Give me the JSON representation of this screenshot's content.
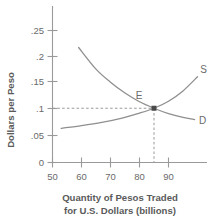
{
  "chart_data": {
    "type": "line",
    "title": "",
    "xlabel": "Quantity of Pesos Traded for U.S. Dollars (billions)",
    "xlabel_line1": "Quantity of Pesos Traded",
    "xlabel_line2": "for U.S. Dollars (billions)",
    "ylabel": "Dollars per Peso",
    "xlim": [
      50,
      100
    ],
    "ylim": [
      0,
      0.27
    ],
    "grid": false,
    "legend_position": "inline-curve-end",
    "x_ticks": [
      "50",
      "60",
      "70",
      "80",
      "90"
    ],
    "x_tick_values": [
      50,
      60,
      70,
      80,
      90
    ],
    "y_ticks": [
      "0",
      ".05",
      ".1",
      ".15",
      ".2",
      ".25"
    ],
    "y_tick_values": [
      0,
      0.05,
      0.1,
      0.15,
      0.2,
      0.25
    ],
    "series": [
      {
        "name": "S",
        "label": "S",
        "description": "Supply curve, upward sloping",
        "x": [
          53,
          60,
          67,
          74,
          80,
          85,
          90,
          95,
          100
        ],
        "values": [
          0.063,
          0.068,
          0.074,
          0.082,
          0.091,
          0.1,
          0.113,
          0.132,
          0.158
        ]
      },
      {
        "name": "D",
        "label": "D",
        "description": "Demand curve, downward sloping",
        "x": [
          59,
          65,
          70,
          75,
          80,
          85,
          90,
          95,
          99
        ],
        "values": [
          0.212,
          0.172,
          0.148,
          0.128,
          0.112,
          0.1,
          0.09,
          0.083,
          0.079
        ]
      }
    ],
    "annotations": [
      {
        "name": "equilibrium-point",
        "label": "E",
        "x": 85,
        "y": 0.1,
        "marker": "filled-square",
        "dashed_guides": [
          "horizontal-to-y-axis",
          "vertical-to-x-axis"
        ]
      }
    ],
    "colors": {
      "curve": "#8f8f8f",
      "axis": "#9a9a9a",
      "text": "#5d5d5d",
      "marker": "#4a4a4a",
      "background": "#ffffff"
    }
  }
}
